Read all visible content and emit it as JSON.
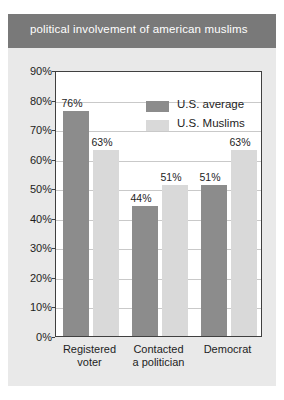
{
  "chart_data": {
    "type": "bar",
    "title": "political involvement of american muslims",
    "xlabel": "",
    "ylabel": "",
    "ylim": [
      0,
      90
    ],
    "ytick_labels": [
      "90%",
      "80%",
      "70%",
      "60%",
      "50%",
      "40%",
      "30%",
      "20%",
      "10%",
      "0%"
    ],
    "ytick_values": [
      90,
      80,
      70,
      60,
      50,
      40,
      30,
      20,
      10,
      0
    ],
    "grid": true,
    "legend_position": "top-right inside plot",
    "categories": [
      "Registered voter",
      "Contacted a politician",
      "Democrat"
    ],
    "category_lines": [
      [
        "Registered",
        "voter"
      ],
      [
        "Contacted",
        "a politician"
      ],
      [
        "Democrat",
        ""
      ]
    ],
    "series": [
      {
        "name": "U.S. average",
        "color": "#8c8c8c",
        "values": [
          76,
          44,
          51
        ],
        "labels": [
          "76%",
          "44%",
          "51%"
        ]
      },
      {
        "name": "U.S. Muslims",
        "color": "#d9d9d9",
        "values": [
          63,
          51,
          63
        ],
        "labels": [
          "63%",
          "51%",
          "63%"
        ]
      }
    ]
  },
  "colors": {
    "banner_background": "#797979",
    "banner_text": "#ffffff",
    "figure_background": "#e9e9e9",
    "plot_background": "#ffffff",
    "plot_border": "#404040",
    "gridline": "#c9c9c9",
    "series_dark": "#8c8c8c",
    "series_light": "#d9d9d9",
    "text": "#1d1d1d"
  }
}
